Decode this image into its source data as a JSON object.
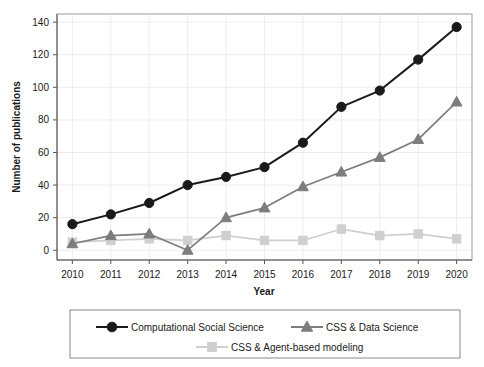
{
  "chart_data": {
    "type": "line",
    "title": "",
    "xlabel": "Year",
    "ylabel": "Number of publications",
    "categories": [
      2010,
      2011,
      2012,
      2013,
      2014,
      2015,
      2016,
      2017,
      2018,
      2019,
      2020
    ],
    "x_tick_labels": [
      "2010",
      "2011",
      "2012",
      "2013",
      "2014",
      "2015",
      "2016",
      "2017",
      "2018",
      "2019",
      "2020"
    ],
    "y_tick_labels": [
      "0",
      "20",
      "40",
      "60",
      "80",
      "100",
      "120",
      "140"
    ],
    "y_ticks": [
      0,
      20,
      40,
      60,
      80,
      100,
      120,
      140
    ],
    "ylim": [
      -6,
      145
    ],
    "xlim": [
      2009.6,
      2020.4
    ],
    "grid": true,
    "legend_position": "bottom",
    "series": [
      {
        "name": "Computational Social Science",
        "marker": "circle",
        "color": "#1a1a1a",
        "values": [
          16,
          22,
          29,
          40,
          45,
          51,
          66,
          88,
          98,
          117,
          137
        ]
      },
      {
        "name": "CSS & Data Science",
        "marker": "triangle",
        "color": "#7d7d7d",
        "values": [
          4,
          9,
          10,
          0,
          20,
          26,
          39,
          48,
          57,
          68,
          91
        ]
      },
      {
        "name": "CSS & Agent-based modeling",
        "marker": "square",
        "color": "#cfcfcf",
        "values": [
          5,
          6,
          7,
          6,
          9,
          6,
          6,
          13,
          9,
          10,
          7
        ]
      }
    ]
  },
  "legend": {
    "entries": [
      {
        "label": "Computational Social Science",
        "marker": "circle-marker",
        "color": "#1a1a1a"
      },
      {
        "label": "CSS & Data Science",
        "marker": "triangle-marker",
        "color": "#7d7d7d"
      },
      {
        "label": "CSS & Agent-based modeling",
        "marker": "square-marker",
        "color": "#cfcfcf"
      }
    ]
  }
}
